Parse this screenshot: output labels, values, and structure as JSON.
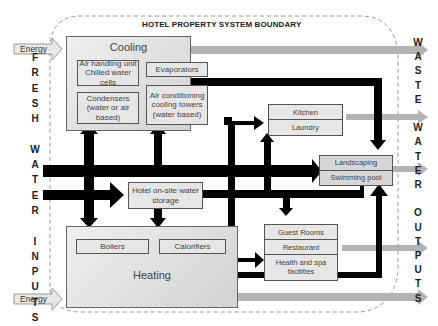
{
  "boundary": {
    "title": "HOTEL PROPERTY SYSTEM BOUNDARY"
  },
  "inputs": {
    "side_label_letters": [
      "F",
      "R",
      "E",
      "S",
      "H",
      "",
      "W",
      "A",
      "T",
      "E",
      "R",
      "",
      "I",
      "N",
      "P",
      "U",
      "T",
      "S"
    ],
    "side_label": "FRESH WATER INPUTS",
    "energy_top": "Energy",
    "energy_bottom": "Energy"
  },
  "outputs": {
    "side_label_letters": [
      "W",
      "A",
      "S",
      "T",
      "E",
      "",
      "W",
      "A",
      "T",
      "E",
      "R",
      "",
      "O",
      "U",
      "T",
      "P",
      "U",
      "T",
      "S"
    ],
    "side_label": "WASTE WATER OUTPUTS"
  },
  "cooling": {
    "title": "Cooling",
    "components": [
      "Air handling unit Chilled water cells",
      "Evaporators",
      "Condensers (water or air based)",
      "Air conditioning cooling towers (water based)"
    ]
  },
  "heating": {
    "title": "Heating",
    "components": [
      "Boilers",
      "Calorifiers"
    ]
  },
  "storage": {
    "label": "Hotel on-site water storage"
  },
  "kitchen_laundry": {
    "items": [
      "Kitchen",
      "Laundry"
    ]
  },
  "landscaping_pool": {
    "items": [
      "Landscaping",
      "Swimming pool"
    ]
  },
  "guest_facilities": {
    "items": [
      "Guest Rooms",
      "Restaurant",
      "Health and spa facilities"
    ]
  },
  "colors": {
    "water_flow": "#000000",
    "waste_flow": "#b3b3b3",
    "energy_arrow_fill": "#e8e8e8",
    "boundary_dash": "#999999",
    "box_fill": "#e6e6e6"
  }
}
